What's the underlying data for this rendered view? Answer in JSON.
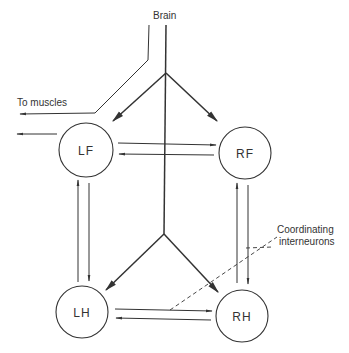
{
  "diagram": {
    "labels": {
      "brain": "Brain",
      "to_muscles": "To muscles",
      "coordinating_line1": "Coordinating",
      "coordinating_line2": "interneurons"
    },
    "nodes": [
      {
        "id": "LF",
        "label": "LF"
      },
      {
        "id": "RF",
        "label": "RF"
      },
      {
        "id": "LH",
        "label": "LH"
      },
      {
        "id": "RH",
        "label": "RH"
      }
    ],
    "edges": [
      {
        "from": "Brain",
        "to": "LF"
      },
      {
        "from": "Brain",
        "to": "RF"
      },
      {
        "from": "Brain",
        "to": "LH"
      },
      {
        "from": "Brain",
        "to": "RH"
      },
      {
        "from": "LF",
        "to": "RF"
      },
      {
        "from": "RF",
        "to": "LF"
      },
      {
        "from": "LH",
        "to": "RH"
      },
      {
        "from": "RH",
        "to": "LH"
      },
      {
        "from": "LH",
        "to": "LF"
      },
      {
        "from": "LF",
        "to": "LH"
      },
      {
        "from": "RH",
        "to": "RF"
      },
      {
        "from": "RF",
        "to": "RH"
      },
      {
        "from": "LF",
        "to": "To muscles"
      }
    ],
    "colors": {
      "ink": "#333333",
      "background": "#ffffff"
    }
  }
}
